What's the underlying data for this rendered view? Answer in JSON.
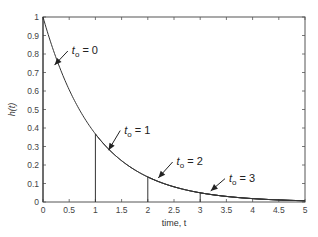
{
  "chart_data": {
    "type": "line",
    "title": "",
    "xlabel": "time, t",
    "ylabel": "h(t)",
    "xlim": [
      0,
      5
    ],
    "ylim": [
      0,
      1
    ],
    "grid": false,
    "x_ticks": [
      "0",
      "0.5",
      "1",
      "1.5",
      "2",
      "2.5",
      "3",
      "3.5",
      "4",
      "4.5",
      "5"
    ],
    "y_ticks": [
      "0",
      "0.1",
      "0.2",
      "0.3",
      "0.4",
      "0.5",
      "0.6",
      "0.7",
      "0.8",
      "0.9",
      "1"
    ],
    "series": [
      {
        "name": "t0 = 0",
        "t0": 0,
        "peak": 1.0,
        "formula": "h(t) = e^{-t}, t >= t0"
      },
      {
        "name": "t0 = 1",
        "t0": 1,
        "peak": 0.368,
        "formula": "h(t) = e^{-t}, t >= t0"
      },
      {
        "name": "t0 = 2",
        "t0": 2,
        "peak": 0.135,
        "formula": "h(t) = e^{-t}, t >= t0"
      },
      {
        "name": "t0 = 3",
        "t0": 3,
        "peak": 0.05,
        "formula": "h(t) = e^{-t}, t >= t0"
      }
    ],
    "annotations": [
      {
        "label_main": "t",
        "label_sub": "o",
        "label_rest": " = 0",
        "text_x": 0.55,
        "text_y": 0.8,
        "arrow_to": [
          0.22,
          0.74
        ]
      },
      {
        "label_main": "t",
        "label_sub": "o",
        "label_rest": " = 1",
        "text_x": 1.55,
        "text_y": 0.37,
        "arrow_to": [
          1.25,
          0.28
        ]
      },
      {
        "label_main": "t",
        "label_sub": "o",
        "label_rest": " = 2",
        "text_x": 2.55,
        "text_y": 0.2,
        "arrow_to": [
          2.2,
          0.13
        ]
      },
      {
        "label_main": "t",
        "label_sub": "o",
        "label_rest": " = 3",
        "text_x": 3.55,
        "text_y": 0.11,
        "arrow_to": [
          3.2,
          0.06
        ]
      }
    ]
  }
}
